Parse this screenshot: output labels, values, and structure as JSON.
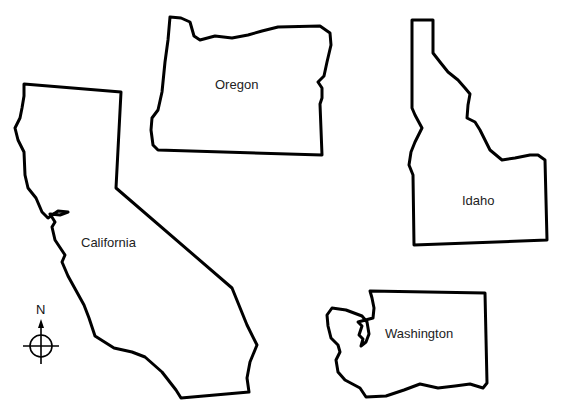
{
  "map": {
    "background": "#ffffff",
    "outline_color": "#000000",
    "states": [
      {
        "id": "oregon",
        "label": "Oregon"
      },
      {
        "id": "idaho",
        "label": "Idaho"
      },
      {
        "id": "california",
        "label": "California"
      },
      {
        "id": "washington",
        "label": "Washington"
      }
    ],
    "compass": {
      "north_label": "N"
    }
  }
}
